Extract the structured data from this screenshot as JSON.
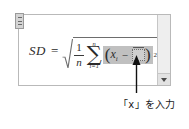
{
  "equation": {
    "lhs": "SD",
    "equals": "=",
    "fraction": {
      "numerator": "1",
      "denominator": "n"
    },
    "summation": {
      "symbol": "∑",
      "upper_limit": "n",
      "lower_limit": "i=1"
    },
    "group": {
      "open_paren": "(",
      "variable": "x",
      "subscript": "i",
      "operator": "−",
      "placeholder": "",
      "close_paren": ")",
      "exponent": "2"
    },
    "radical_symbol": "√"
  },
  "annotation": {
    "text": "「x」を入力",
    "arrow": "up-arrow"
  },
  "scrollbar": {
    "down_arrow": "chevron-down-icon"
  },
  "handle": {
    "name": "drag-handle"
  },
  "colors": {
    "selection": "#c0c0c0",
    "frame_border": "#b9b9b9",
    "scrollbar_track": "#eeeeee",
    "text": "#2b2b2b"
  }
}
